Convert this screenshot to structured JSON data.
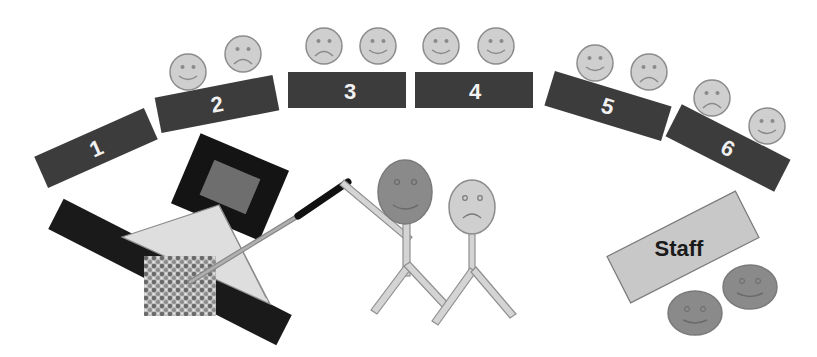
{
  "diagram": {
    "type": "classroom-layout",
    "colors": {
      "table": "#3c3c3c",
      "table_text": "#f2f2f2",
      "face_light": "#cfcfcf",
      "face_dark": "#8a8a8a",
      "face_stroke": "#8c8c8c",
      "staff_fill": "#c8c8c8",
      "projector_frame": "#141414",
      "projector_screen": "#6e6e6e",
      "triangle": "#dedede",
      "bar": "#1a1a1a"
    },
    "tables": [
      {
        "label": "1",
        "faces": []
      },
      {
        "label": "2",
        "faces": [
          "smile",
          "frown"
        ]
      },
      {
        "label": "3",
        "faces": [
          "frown",
          "smile"
        ]
      },
      {
        "label": "4",
        "faces": [
          "smile",
          "smile"
        ]
      },
      {
        "label": "5",
        "faces": [
          "smile",
          "frown"
        ]
      },
      {
        "label": "6",
        "faces": [
          "frown",
          "smile"
        ]
      }
    ],
    "staff": {
      "label": "Staff",
      "faces": [
        "smile",
        "smile"
      ]
    },
    "presenters": [
      {
        "name": "teacher",
        "expression": "smile",
        "shade": "dark",
        "holds": "pointer"
      },
      {
        "name": "student",
        "expression": "frown",
        "shade": "light"
      }
    ],
    "equipment": [
      "projector",
      "whiteboard-triangle",
      "textured-board",
      "pointer"
    ]
  }
}
